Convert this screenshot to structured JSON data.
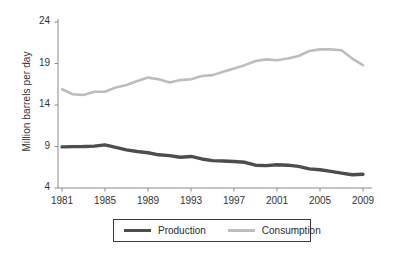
{
  "chart_data": {
    "type": "line",
    "title": "",
    "xlabel": "",
    "ylabel": "Million barrels per day",
    "xlim": [
      1981,
      2009
    ],
    "ylim": [
      4,
      24
    ],
    "grid": false,
    "legend_position": "bottom",
    "x": [
      1981,
      1982,
      1983,
      1984,
      1985,
      1986,
      1987,
      1988,
      1989,
      1990,
      1991,
      1992,
      1993,
      1994,
      1995,
      1996,
      1997,
      1998,
      1999,
      2000,
      2001,
      2002,
      2003,
      2004,
      2005,
      2006,
      2007,
      2008,
      2009
    ],
    "xticks": [
      1981,
      1985,
      1989,
      1993,
      1997,
      2001,
      2005,
      2009
    ],
    "xticklabels": [
      "1981",
      "1985",
      "1989",
      "1993",
      "1997",
      "2001",
      "2005",
      "2009"
    ],
    "yticks": [
      4,
      9,
      14,
      19,
      24
    ],
    "yticklabels": [
      "4",
      "9",
      "14",
      "19",
      "24"
    ],
    "series": [
      {
        "name": "Production",
        "color": "#4d4d4d",
        "width": 3.4,
        "values": [
          8.95,
          8.98,
          9.0,
          9.05,
          9.2,
          8.9,
          8.6,
          8.4,
          8.25,
          8.0,
          7.9,
          7.7,
          7.8,
          7.5,
          7.3,
          7.25,
          7.2,
          7.1,
          6.75,
          6.7,
          6.8,
          6.75,
          6.6,
          6.3,
          6.2,
          6.0,
          5.8,
          5.6,
          5.65
        ]
      },
      {
        "name": "Consumption",
        "color": "#bdbdbd",
        "width": 2.6,
        "values": [
          15.9,
          15.3,
          15.2,
          15.6,
          15.6,
          16.1,
          16.4,
          16.9,
          17.3,
          17.1,
          16.7,
          17.0,
          17.1,
          17.5,
          17.6,
          18.0,
          18.4,
          18.8,
          19.3,
          19.5,
          19.4,
          19.6,
          19.9,
          20.5,
          20.7,
          20.7,
          20.6,
          19.6,
          18.8
        ]
      }
    ]
  },
  "axis": {
    "y_title": "Million barrels per day"
  },
  "legend": {
    "items": [
      {
        "label": "Production",
        "color": "#4d4d4d"
      },
      {
        "label": "Consumption",
        "color": "#bdbdbd"
      }
    ]
  }
}
